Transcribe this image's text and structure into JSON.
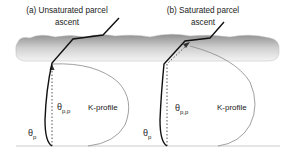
{
  "panels": [
    {
      "id": "a",
      "title_line1": "(a) Unsaturated parcel",
      "title_line2": "ascent",
      "theta_p": "θ",
      "theta_p_sub": "p",
      "theta_pp": "θ",
      "theta_pp_sub": "p,p",
      "k_profile": "K-profile"
    },
    {
      "id": "b",
      "title_line1": "(b)  Saturated parcel",
      "title_line2": "ascent",
      "theta_p": "θ",
      "theta_p_sub": "p",
      "theta_pp": "θ",
      "theta_pp_sub": "p,p",
      "k_profile": "K-profile"
    }
  ],
  "colors": {
    "cloud_top": "#9a9a9a",
    "cloud_bottom": "#f2f2f2",
    "line": "#111111",
    "k_profile_curve": "#888888",
    "ground": "#dddddd"
  }
}
